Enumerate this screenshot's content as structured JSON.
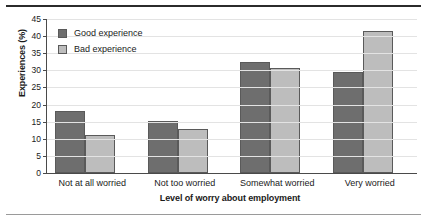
{
  "chart_data": {
    "type": "bar",
    "title": "",
    "xlabel": "Level of worry about employment",
    "ylabel": "Experiences (%)",
    "categories": [
      "Not at all worried",
      "Not too worried",
      "Somewhat worried",
      "Very worried"
    ],
    "series": [
      {
        "name": "Good experience",
        "color": "#6e6e6e",
        "values": [
          18.2,
          15.3,
          32.5,
          29.4
        ]
      },
      {
        "name": "Bad experience",
        "color": "#bdbdbd",
        "values": [
          11.1,
          12.9,
          30.7,
          41.5
        ]
      }
    ],
    "ylim": [
      0,
      45
    ],
    "ytick_step": 5,
    "yticks": [
      "45",
      "40",
      "35",
      "30",
      "25",
      "20",
      "15",
      "10",
      "5",
      "0"
    ],
    "grid": true,
    "legend_position": "top-left"
  },
  "decoration": {
    "rule_top_color": "#2b2b2b",
    "rule_bottom_color": "#9a9a9a"
  }
}
